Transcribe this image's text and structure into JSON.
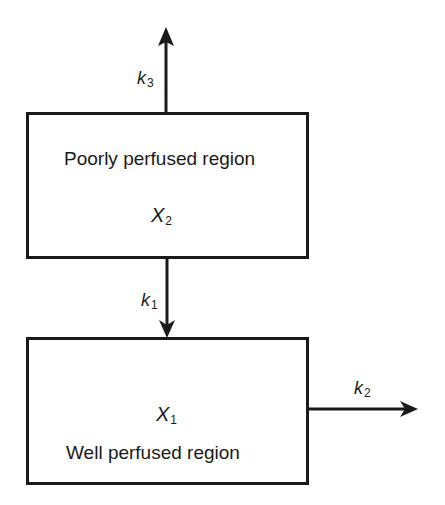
{
  "diagram": {
    "type": "compartment-model",
    "compartments": [
      {
        "id": "poorly-perfused",
        "title": "Poorly perfused region",
        "variable": "X",
        "variable_subscript": "2"
      },
      {
        "id": "well-perfused",
        "title": "Well perfused region",
        "variable": "X",
        "variable_subscript": "1"
      }
    ],
    "flows": [
      {
        "id": "k3",
        "symbol": "k",
        "subscript": "3",
        "from": "poorly-perfused",
        "to": "outside-up"
      },
      {
        "id": "k1",
        "symbol": "k",
        "subscript": "1",
        "from": "poorly-perfused",
        "to": "well-perfused"
      },
      {
        "id": "k2",
        "symbol": "k",
        "subscript": "2",
        "from": "well-perfused",
        "to": "outside-right"
      }
    ],
    "colors": {
      "stroke": "#1a1a1a",
      "background": "#ffffff"
    }
  }
}
